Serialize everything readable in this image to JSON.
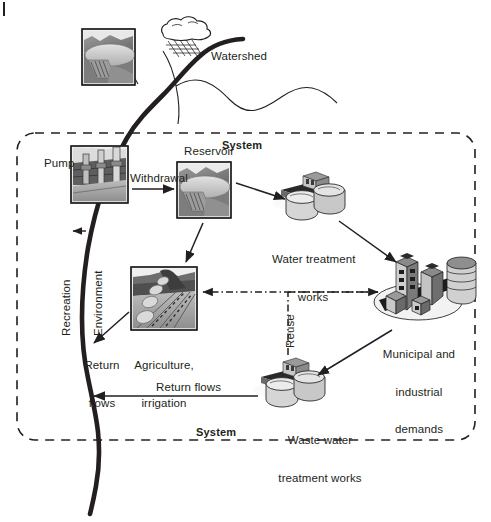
{
  "figure": {
    "title_none": "",
    "labels": {
      "watershed": "Watershed",
      "system_top": "System",
      "system_bottom": "System",
      "pump": "Pump",
      "withdrawal": "Withdrawal",
      "reservoir": "Reservoir",
      "water_treatment_line1": "Water treatment",
      "water_treatment_line2": "works",
      "municipal_line1": "Municipal and",
      "municipal_line2": "industrial",
      "municipal_line3": "demands",
      "agriculture_line1": "Agriculture,",
      "agriculture_line2": "irrigation",
      "return_flows_left_line1": "Return",
      "return_flows_left_line2": "flows",
      "return_flows_bottom": "Return flows",
      "waste_water_line1": "Waste water",
      "waste_water_line2": "treatment works",
      "reuse": "Reuse",
      "recreation": "Recreation",
      "environment": "Environment"
    },
    "icons": {
      "reservoir_source": "reservoir-dam-photo-icon",
      "rain_cloud": "rain-cloud-icon",
      "pump_station": "pump-station-photo-icon",
      "reservoir_store": "reservoir-dam-photo-icon",
      "water_treatment": "treatment-tanks-icon",
      "waste_water_treatment": "treatment-tanks-icon",
      "city": "city-buildings-icon",
      "farm": "irrigated-field-photo-icon",
      "river": "river-course-icon"
    },
    "colors": {
      "ink": "#231f20",
      "photo_dark": "#4d4d4d",
      "photo_mid": "#8c8c8c",
      "photo_light": "#c4c4c4",
      "paper": "#ffffff"
    }
  }
}
